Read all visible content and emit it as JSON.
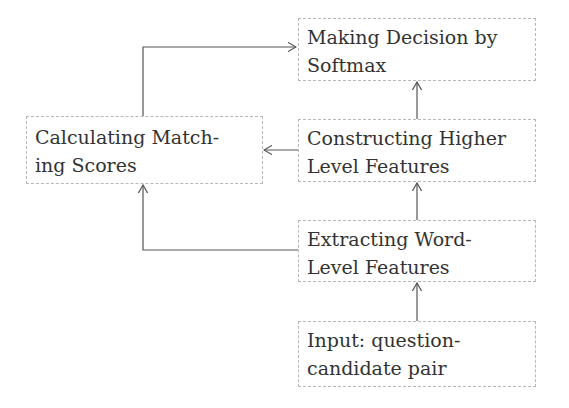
{
  "diagram": {
    "nodes": [
      {
        "id": "softmax",
        "label_line1": "Making Decision by",
        "label_line2": "Softmax"
      },
      {
        "id": "higher",
        "label_line1": "Constructing Higher",
        "label_line2": "Level Features"
      },
      {
        "id": "word",
        "label_line1": "Extracting Word-",
        "label_line2": "Level Features"
      },
      {
        "id": "input",
        "label_line1": "Input: question-",
        "label_line2": "candidate pair"
      },
      {
        "id": "matching",
        "label_line1": "Calculating Match-",
        "label_line2": "ing Scores"
      }
    ],
    "edges": [
      {
        "from": "input",
        "to": "word"
      },
      {
        "from": "word",
        "to": "higher"
      },
      {
        "from": "higher",
        "to": "softmax"
      },
      {
        "from": "higher",
        "to": "matching"
      },
      {
        "from": "word",
        "to": "matching"
      },
      {
        "from": "matching",
        "to": "softmax"
      }
    ],
    "colors": {
      "line": "#555555",
      "border": "#b8b8b8",
      "text": "#333333"
    }
  }
}
